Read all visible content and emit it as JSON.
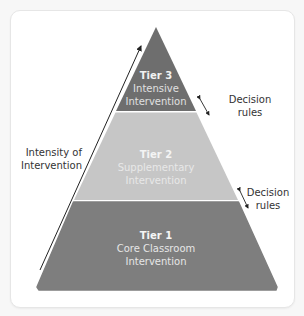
{
  "diagram": {
    "type": "pyramid",
    "colors": {
      "background": "#f7f7f7",
      "card": "#ffffff",
      "tier3_fill": "#6e6e6e",
      "tier2_fill": "#c6c6c6",
      "tier1_fill": "#7e7e7e",
      "arrow": "#222222",
      "text_dark": "#333333"
    },
    "tiers": [
      {
        "id": "tier3",
        "title": "Tier 3",
        "subtitle_line1": "Intensive",
        "subtitle_line2": "Intervention"
      },
      {
        "id": "tier2",
        "title": "Tier 2",
        "subtitle_line1": "Supplementary",
        "subtitle_line2": "Intervention"
      },
      {
        "id": "tier1",
        "title": "Tier 1",
        "subtitle_line1": "Core Classroom",
        "subtitle_line2": "Intervention"
      }
    ],
    "intensity_label": {
      "line1": "Intensity of",
      "line2": "Intervention"
    },
    "decision_rules": [
      {
        "line1": "Decision",
        "line2": "rules"
      },
      {
        "line1": "Decision",
        "line2": "rules"
      }
    ]
  }
}
